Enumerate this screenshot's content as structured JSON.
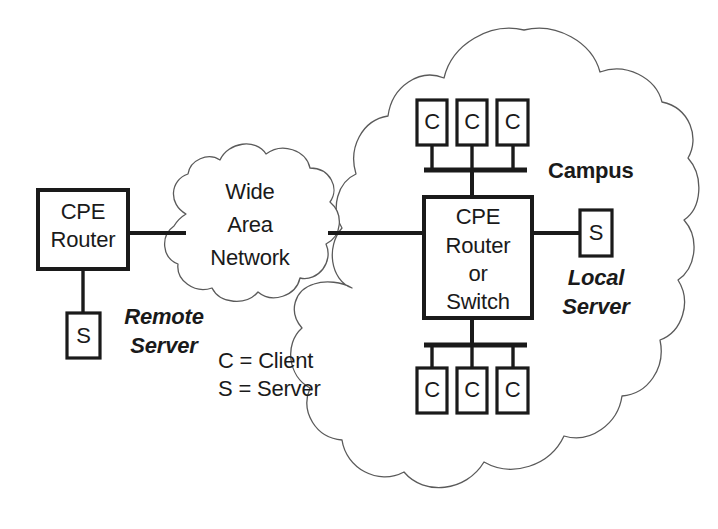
{
  "diagram": {
    "colors": {
      "stroke_dark": "#1a1a1a",
      "cloud_outline": "#5a5a5a",
      "background": "#ffffff"
    },
    "clouds": [
      {
        "id": "wan",
        "label_lines": [
          "Wide",
          "Area",
          "Network"
        ]
      },
      {
        "id": "campus",
        "label": "Campus"
      }
    ],
    "remote_site": {
      "router": {
        "lines": [
          "CPE",
          "Router"
        ]
      },
      "server": {
        "glyph": "S",
        "caption_lines": [
          "Remote",
          "Server"
        ]
      }
    },
    "campus_site": {
      "router": {
        "lines": [
          "CPE",
          "Router",
          "or",
          "Switch"
        ]
      },
      "local_server": {
        "glyph": "S",
        "caption_lines": [
          "Local",
          "Server"
        ]
      },
      "clients_top": [
        {
          "glyph": "C"
        },
        {
          "glyph": "C"
        },
        {
          "glyph": "C"
        }
      ],
      "clients_bottom": [
        {
          "glyph": "C"
        },
        {
          "glyph": "C"
        },
        {
          "glyph": "C"
        }
      ]
    },
    "legend": {
      "lines": [
        "C = Client",
        "S = Server"
      ]
    }
  }
}
